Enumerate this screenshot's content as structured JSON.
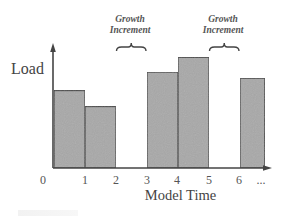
{
  "chart_data": {
    "type": "bar",
    "title": "",
    "xlabel": "Model Time",
    "ylabel": "Load",
    "x_ticks": [
      "0",
      "1",
      "2",
      "3",
      "4",
      "5",
      "6",
      "..."
    ],
    "bars": [
      {
        "start": 0,
        "end": 1,
        "load": 0.63
      },
      {
        "start": 1,
        "end": 2,
        "load": 0.5
      },
      {
        "start": 3,
        "end": 4,
        "load": 0.78
      },
      {
        "start": 4,
        "end": 5,
        "load": 0.9
      },
      {
        "start": 6,
        "end": 6.8,
        "load": 0.73
      }
    ],
    "gaps": [
      {
        "start": 2,
        "end": 3,
        "annotation": "Growth Increment"
      },
      {
        "start": 5,
        "end": 6,
        "annotation": "Growth Increment"
      }
    ],
    "ylim": [
      0,
      1
    ],
    "grid": false,
    "legend": null,
    "bar_color": "#a8a8a8",
    "bar_edge_color": "#444444"
  },
  "labels": {
    "ylabel": "Load",
    "xlabel": "Model Time",
    "annotations": [
      {
        "line1": "Growth",
        "line2": "Increment"
      },
      {
        "line1": "Growth",
        "line2": "Increment"
      }
    ],
    "ticks": [
      "0",
      "1",
      "2",
      "3",
      "4",
      "5",
      "6",
      "..."
    ]
  }
}
